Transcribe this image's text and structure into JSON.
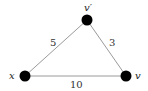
{
  "graph": {
    "nodes": [
      {
        "id": "vprime",
        "label": "v′",
        "x": 87,
        "y": 20
      },
      {
        "id": "x",
        "label": "x",
        "x": 25,
        "y": 76
      },
      {
        "id": "v",
        "label": "v",
        "x": 126,
        "y": 76
      }
    ],
    "edges": [
      {
        "from": "x",
        "to": "vprime",
        "weight": "5"
      },
      {
        "from": "vprime",
        "to": "v",
        "weight": "3"
      },
      {
        "from": "x",
        "to": "v",
        "weight": "10"
      }
    ],
    "colors": {
      "node": "#000000",
      "edge": "#999999"
    }
  }
}
